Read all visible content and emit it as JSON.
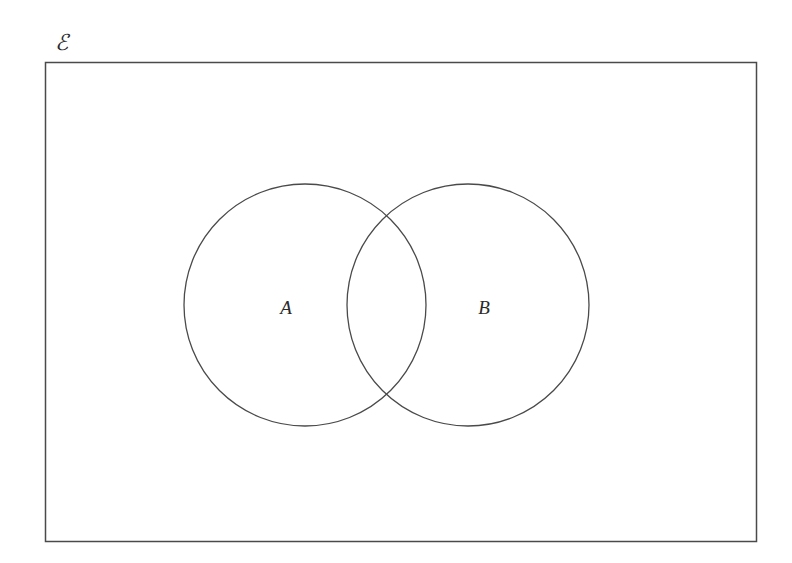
{
  "diagram": {
    "type": "venn",
    "universe": {
      "label": "ℰ",
      "rect": {
        "x": 45,
        "y": 62,
        "width": 711,
        "height": 479
      }
    },
    "sets": [
      {
        "label": "A",
        "cx": 305,
        "cy": 305,
        "r": 121,
        "label_x": 286,
        "label_y": 307
      },
      {
        "label": "B",
        "cx": 468,
        "cy": 305,
        "r": 121,
        "label_x": 484,
        "label_y": 307
      }
    ],
    "colors": {
      "stroke": "#4a4a4a",
      "background": "#ffffff",
      "text": "#2a2a2a"
    }
  }
}
